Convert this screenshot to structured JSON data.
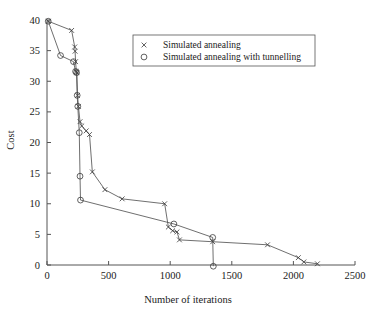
{
  "chart_data": {
    "type": "line",
    "title": "",
    "xlabel": "Number of iterations",
    "ylabel": "Cost",
    "xlim": [
      0,
      2500
    ],
    "ylim": [
      0,
      40
    ],
    "xticks": [
      0,
      500,
      1000,
      1500,
      2000,
      2500
    ],
    "yticks": [
      0,
      5,
      10,
      15,
      20,
      25,
      30,
      35,
      40
    ],
    "grid": false,
    "legend_position": "top-center",
    "series": [
      {
        "name": "Simulated annealing",
        "marker": "x",
        "color": "#3a3a3a",
        "points": [
          [
            10,
            39.8
          ],
          [
            200,
            38.3
          ],
          [
            225,
            35.6
          ],
          [
            228,
            34.9
          ],
          [
            232,
            33.2
          ],
          [
            238,
            31.6
          ],
          [
            242,
            31.4
          ],
          [
            248,
            27.7
          ],
          [
            255,
            25.9
          ],
          [
            268,
            23.4
          ],
          [
            282,
            22.7
          ],
          [
            318,
            21.9
          ],
          [
            345,
            21.3
          ],
          [
            368,
            15.2
          ],
          [
            470,
            12.3
          ],
          [
            610,
            10.8
          ],
          [
            955,
            10.0
          ],
          [
            985,
            6.2
          ],
          [
            1020,
            5.6
          ],
          [
            1055,
            5.4
          ],
          [
            1075,
            4.1
          ],
          [
            1345,
            3.8
          ],
          [
            1790,
            3.3
          ],
          [
            2040,
            1.2
          ],
          [
            2085,
            0.5
          ],
          [
            2195,
            0.2
          ]
        ]
      },
      {
        "name": "Simulated annealing with tunnelling",
        "marker": "o",
        "color": "#3a3a3a",
        "points": [
          [
            10,
            39.8
          ],
          [
            110,
            34.2
          ],
          [
            215,
            33.2
          ],
          [
            232,
            31.6
          ],
          [
            240,
            31.4
          ],
          [
            245,
            27.7
          ],
          [
            250,
            25.9
          ],
          [
            262,
            21.6
          ],
          [
            268,
            14.5
          ],
          [
            272,
            10.6
          ],
          [
            1030,
            6.7
          ],
          [
            1345,
            4.5
          ],
          [
            1350,
            -0.2
          ]
        ]
      }
    ]
  },
  "legend": {
    "entries": [
      {
        "marker": "x",
        "label": "Simulated annealing"
      },
      {
        "marker": "o",
        "label": "Simulated annealing with tunnelling"
      }
    ]
  },
  "axes": {
    "x_title": "Number of iterations",
    "y_title": "Cost",
    "x_tick_labels": [
      "0",
      "500",
      "1000",
      "1500",
      "2000",
      "2500"
    ],
    "y_tick_labels": [
      "0",
      "5",
      "10",
      "15",
      "20",
      "25",
      "30",
      "35",
      "40"
    ]
  },
  "colors": {
    "axis": "#555555",
    "line": "#4a4a4a",
    "marker": "#3a3a3a",
    "background": "#ffffff"
  }
}
